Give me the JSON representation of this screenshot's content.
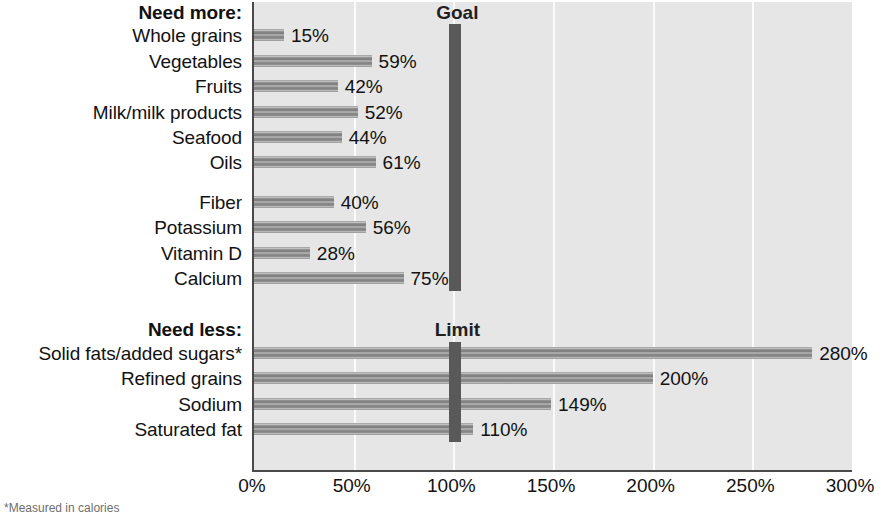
{
  "chart_data": {
    "type": "bar",
    "orientation": "horizontal",
    "title": "",
    "xlabel": "",
    "ylabel": "",
    "xlim": [
      0,
      300
    ],
    "xticks": [
      "0%",
      "50%",
      "100%",
      "150%",
      "200%",
      "250%",
      "300%"
    ],
    "xtick_values": [
      0,
      50,
      100,
      150,
      200,
      250,
      300
    ],
    "grid": true,
    "gridlines_at": [
      50,
      100,
      150,
      200,
      250
    ],
    "legend_position": "none",
    "sections": [
      {
        "heading": "Need more:",
        "marker_label": "Goal",
        "marker_value": 100,
        "groups": [
          {
            "items": [
              {
                "label": "Whole grains",
                "value": 15,
                "value_label": "15%"
              },
              {
                "label": "Vegetables",
                "value": 59,
                "value_label": "59%"
              },
              {
                "label": "Fruits",
                "value": 42,
                "value_label": "42%"
              },
              {
                "label": "Milk/milk products",
                "value": 52,
                "value_label": "52%"
              },
              {
                "label": "Seafood",
                "value": 44,
                "value_label": "44%"
              },
              {
                "label": "Oils",
                "value": 61,
                "value_label": "61%"
              }
            ]
          },
          {
            "items": [
              {
                "label": "Fiber",
                "value": 40,
                "value_label": "40%"
              },
              {
                "label": "Potassium",
                "value": 56,
                "value_label": "56%"
              },
              {
                "label": "Vitamin D",
                "value": 28,
                "value_label": "28%"
              },
              {
                "label": "Calcium",
                "value": 75,
                "value_label": "75%"
              }
            ]
          }
        ]
      },
      {
        "heading": "Need less:",
        "marker_label": "Limit",
        "marker_value": 100,
        "groups": [
          {
            "items": [
              {
                "label": "Solid fats/added sugars*",
                "value": 280,
                "value_label": "280%"
              },
              {
                "label": "Refined grains",
                "value": 200,
                "value_label": "200%"
              },
              {
                "label": "Sodium",
                "value": 149,
                "value_label": "149%"
              },
              {
                "label": "Saturated fat",
                "value": 110,
                "value_label": "110%"
              }
            ]
          }
        ]
      }
    ]
  },
  "footnote": "*Measured in calories",
  "colors": {
    "bar": "#8d8d8d",
    "marker": "#595959",
    "plot_background": "#e6e6e6",
    "gridline": "#fbfbfb",
    "axis": "#4a4a4a",
    "text": "#121212"
  }
}
